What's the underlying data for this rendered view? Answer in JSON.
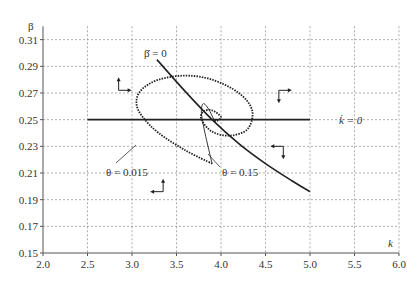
{
  "chart_data": {
    "type": "line",
    "title": "",
    "xlabel": "k",
    "ylabel": "β",
    "xlim": [
      2.0,
      6.0
    ],
    "ylim": [
      0.15,
      0.32
    ],
    "grid": true,
    "x_ticks": [
      "2.0",
      "2.5",
      "3.0",
      "3.5",
      "4.0",
      "4.5",
      "5.0",
      "5.5",
      "6.0"
    ],
    "y_ticks": [
      "0.15",
      "0.17",
      "0.19",
      "0.21",
      "0.23",
      "0.25",
      "0.27",
      "0.29",
      "0.31"
    ],
    "series": [
      {
        "name": "k̇ = 0",
        "style": "solid",
        "x": [
          2.5,
          5.0
        ],
        "y": [
          0.25,
          0.25
        ]
      },
      {
        "name": "β̇ = 0",
        "style": "solid",
        "x": [
          3.28,
          3.6,
          3.9,
          4.2,
          4.5,
          4.8,
          5.0
        ],
        "y": [
          0.295,
          0.271,
          0.25,
          0.232,
          0.217,
          0.204,
          0.196
        ]
      },
      {
        "name": "θ = 0.015",
        "style": "dotted",
        "x": [
          3.9,
          3.6,
          3.3,
          3.12,
          3.05,
          3.1,
          3.3,
          3.6,
          3.9,
          4.2,
          4.35,
          4.3,
          4.1,
          3.9,
          3.78,
          3.8,
          3.9,
          4.0,
          3.95,
          3.92
        ],
        "y": [
          0.217,
          0.227,
          0.24,
          0.252,
          0.262,
          0.272,
          0.28,
          0.283,
          0.28,
          0.27,
          0.257,
          0.243,
          0.238,
          0.241,
          0.25,
          0.256,
          0.257,
          0.252,
          0.249,
          0.25
        ]
      },
      {
        "name": "θ = 0.15",
        "style": "solid-thin",
        "x": [
          3.9,
          3.82,
          3.78,
          3.8,
          3.86,
          3.92
        ],
        "y": [
          0.217,
          0.24,
          0.255,
          0.262,
          0.258,
          0.25
        ]
      }
    ],
    "annotations": [
      {
        "text": "β̇ = 0",
        "x": 3.35,
        "y": 0.296
      },
      {
        "text": "k̇ = 0",
        "x": 5.45,
        "y": 0.25
      },
      {
        "text": "θ = 0.015",
        "x": 3.1,
        "y": 0.21
      },
      {
        "text": "θ = 0.15",
        "x": 4.25,
        "y": 0.21
      }
    ],
    "direction_arrows": [
      {
        "region": "upper-left",
        "x": 2.85,
        "y": 0.272,
        "dirs": [
          "up",
          "right"
        ]
      },
      {
        "region": "upper-right",
        "x": 4.65,
        "y": 0.272,
        "dirs": [
          "down",
          "right"
        ]
      },
      {
        "region": "lower-right",
        "x": 4.7,
        "y": 0.23,
        "dirs": [
          "down",
          "left"
        ]
      },
      {
        "region": "lower-left",
        "x": 3.35,
        "y": 0.196,
        "dirs": [
          "up",
          "left"
        ]
      }
    ]
  },
  "labels": {
    "y_axis": "β",
    "x_axis": "k",
    "beta_dot": "β̇ = 0",
    "k_dot": "k̇ = 0",
    "theta_small": "θ = 0.015",
    "theta_large": "θ = 0.15"
  }
}
